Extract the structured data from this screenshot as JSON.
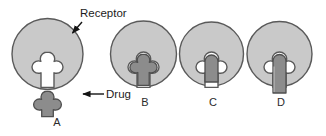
{
  "figure": {
    "width": 326,
    "height": 136,
    "background": "#ffffff"
  },
  "colors": {
    "receptor_fill": "#c9c9c9",
    "receptor_stroke": "#5a5a5a",
    "drug_fill": "#8c8c8c",
    "drug_stroke": "#4f4f4f",
    "cavity_fill": "#ffffff",
    "text": "#1c1c1c",
    "arrow": "#141414"
  },
  "callouts": [
    {
      "id": "receptor",
      "text": "Receptor",
      "arrow": "points down-left to the edge of receptor A"
    },
    {
      "id": "drug",
      "text": "Drug",
      "arrow": "points left to the free drug molecule in panel A"
    }
  ],
  "panels": [
    {
      "id": "a",
      "label": "A",
      "receptor": "circle with clover-shaped binding cavity, unoccupied",
      "ligand": "clover-shaped drug molecule, unbound, below receptor",
      "bound": false
    },
    {
      "id": "b",
      "label": "B",
      "receptor": "circle with clover-shaped binding cavity, fully occupied",
      "ligand": "clover-shaped drug molecule, exact fit in cavity",
      "bound": true
    },
    {
      "id": "c",
      "label": "C",
      "receptor": "circle with clover-shaped binding cavity, partially occupied",
      "ligand": "short rounded-top rectangular molecule, partial fit",
      "bound": true
    },
    {
      "id": "d",
      "label": "D",
      "receptor": "circle with clover-shaped binding cavity, partially occupied",
      "ligand": "tall rounded-top rectangular molecule extending below receptor",
      "bound": true
    }
  ],
  "icons": {
    "receptor_shape": "circle-with-cavity-icon",
    "drug_shape": "clover-molecule-icon",
    "rect_small_shape": "rounded-rect-molecule-icon",
    "rect_tall_shape": "tall-rounded-rect-molecule-icon",
    "arrow_receptor": "arrow-icon",
    "arrow_drug": "arrow-icon"
  }
}
